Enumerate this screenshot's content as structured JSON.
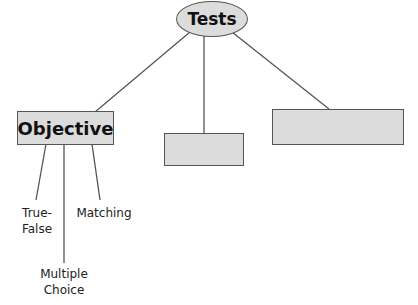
{
  "diagram": {
    "root": {
      "label": "Tests"
    },
    "children": [
      {
        "label": "Objective",
        "children": [
          "True-False",
          "Multiple Choice",
          "Matching"
        ]
      },
      {
        "label": ""
      },
      {
        "label": ""
      }
    ],
    "leaves": {
      "true_false_line1": "True-",
      "true_false_line2": "False",
      "multiple_line1": "Multiple",
      "multiple_line2": "Choice",
      "matching": "Matching"
    },
    "colors": {
      "fill": "#dcdcdc",
      "stroke": "#555555"
    }
  }
}
